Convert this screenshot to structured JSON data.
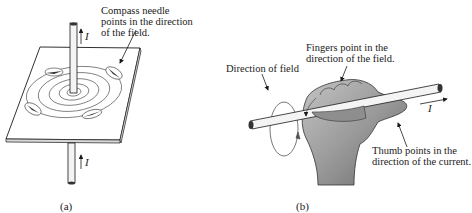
{
  "panel_a": {
    "caption": "(a)",
    "annotation_line1": "Compass needle",
    "annotation_line2": "points in the direction",
    "annotation_line3": "of the field.",
    "current_label_top": "I",
    "current_label_bottom": "I"
  },
  "panel_b": {
    "caption": "(b)",
    "fingers_line1": "Fingers point in the",
    "fingers_line2": "direction of the field.",
    "field_label": "Direction of field",
    "thumb_line1": "Thumb points in the",
    "thumb_line2": "direction of the current.",
    "current_label": "I"
  },
  "colors": {
    "ink": "#1a1a1a",
    "hand_fill": "#9a9a9a",
    "hand_shadow": "#6e6e6e",
    "plate_fill": "#ffffff",
    "wire_fill": "#f4f4f4"
  }
}
